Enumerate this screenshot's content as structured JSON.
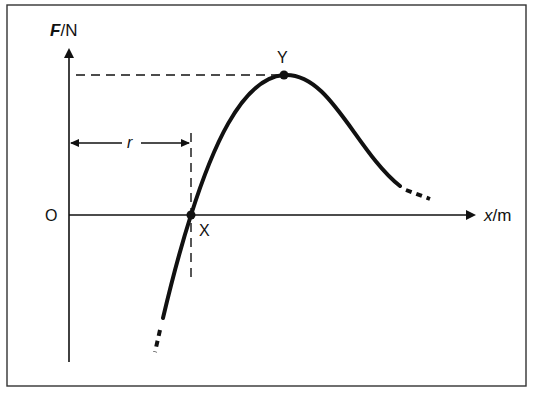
{
  "diagram": {
    "type": "force-displacement graph",
    "y_axis": {
      "symbol": "F",
      "unit": "N",
      "label_sep": "/"
    },
    "x_axis": {
      "symbol": "x",
      "unit": "m",
      "label_sep": "/"
    },
    "origin_label": "O",
    "points": [
      {
        "label": "X",
        "description": "curve crosses x-axis (F = 0)"
      },
      {
        "label": "Y",
        "description": "maximum of curve"
      }
    ],
    "distance_label": "r",
    "colors": {
      "ink": "#111111",
      "background": "#ffffff"
    }
  }
}
